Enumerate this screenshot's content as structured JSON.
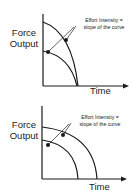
{
  "diagrams": [
    {
      "ylabel_line1": "Force",
      "ylabel_line2": "Output",
      "xlabel": "Time",
      "annotation_line1": "Effort Intensity =",
      "annotation_line2": "slope of the curve",
      "description": "Two concave-down curves from y-axis meeting at the same point on time axis"
    },
    {
      "ylabel_line1": "Force",
      "ylabel_line2": "Output",
      "xlabel": "Time",
      "annotation_line1": "Effort Intensity =",
      "annotation_line2": "slope of the curve",
      "description": "Two concave-down curves from y-axis ending at different points on time axis"
    }
  ],
  "colors": {
    "line": "#1a1a1a",
    "text": "#222222",
    "background": "#ffffff"
  }
}
